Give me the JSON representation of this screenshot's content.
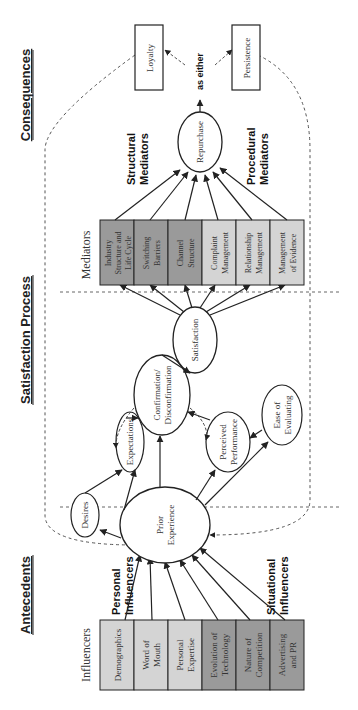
{
  "diagram": {
    "orientation": "rotated-90-ccw",
    "sections": [
      {
        "id": "antecedents",
        "label": "Antecedents"
      },
      {
        "id": "satisfaction-process",
        "label": "Satisfaction Process"
      },
      {
        "id": "consequences",
        "label": "Consequences"
      }
    ],
    "influencers": {
      "heading": "Influencers",
      "personal_label_1": "Personal",
      "personal_label_2": "Influencers",
      "situational_label_1": "Situational",
      "situational_label_2": "Influencers",
      "boxes": [
        {
          "line1": "Demographics",
          "line2": "",
          "group": "personal",
          "fill": "#d4d4d4"
        },
        {
          "line1": "Word of",
          "line2": "Mouth",
          "group": "personal",
          "fill": "#d4d4d4"
        },
        {
          "line1": "Personal",
          "line2": "Expertise",
          "group": "personal",
          "fill": "#d4d4d4"
        },
        {
          "line1": "Evolution of",
          "line2": "Technology",
          "group": "situational",
          "fill": "#9a9a9a"
        },
        {
          "line1": "Nature of",
          "line2": "Competition",
          "group": "situational",
          "fill": "#9a9a9a"
        },
        {
          "line1": "Advertising",
          "line2": "and PR",
          "group": "situational",
          "fill": "#9a9a9a"
        }
      ]
    },
    "process_nodes": {
      "desires": "Desires",
      "expectations": "Expectations",
      "prior_experience_1": "Prior",
      "prior_experience_2": "Experience",
      "confirmation_1": "Confirmation/",
      "confirmation_2": "Disconfirmation",
      "perceived_performance_1": "Perceived",
      "perceived_performance_2": "Performance",
      "ease_of_evaluating_1": "Ease of",
      "ease_of_evaluating_2": "Evaluating",
      "satisfaction": "Satisfaction"
    },
    "mediators": {
      "heading": "Mediators",
      "structural_label_1": "Structural",
      "structural_label_2": "Mediators",
      "procedural_label_1": "Procedural",
      "procedural_label_2": "Mediators",
      "boxes": [
        {
          "line1": "Industry",
          "line2": "Structure and",
          "line3": "Life Cycle",
          "group": "structural",
          "fill": "#9a9a9a"
        },
        {
          "line1": "Switching",
          "line2": "Barriers",
          "line3": "",
          "group": "structural",
          "fill": "#9a9a9a"
        },
        {
          "line1": "Channel",
          "line2": "Structure",
          "line3": "",
          "group": "structural",
          "fill": "#9a9a9a"
        },
        {
          "line1": "Complaint",
          "line2": "Management",
          "line3": "",
          "group": "procedural",
          "fill": "#d4d4d4"
        },
        {
          "line1": "Relationship",
          "line2": "Management",
          "line3": "",
          "group": "procedural",
          "fill": "#d4d4d4"
        },
        {
          "line1": "Management",
          "line2": "of Evidence",
          "line3": "",
          "group": "procedural",
          "fill": "#d4d4d4"
        }
      ]
    },
    "consequences": {
      "repurchase": "Repurchase",
      "as_either": "as either",
      "loyalty": "Loyalty",
      "persistence": "Persistence"
    },
    "colors": {
      "light_box": "#d4d4d4",
      "dark_box": "#9a9a9a",
      "stroke": "#222222",
      "dashed": "#555555"
    }
  }
}
